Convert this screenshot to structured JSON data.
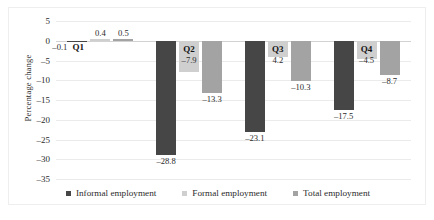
{
  "chart_data": {
    "type": "bar",
    "title": "",
    "subtitle": "",
    "xlabel": "",
    "ylabel": "Percentage change",
    "categories": [
      "Q1",
      "Q2",
      "Q3",
      "Q4"
    ],
    "series": [
      {
        "name": "Informal employment",
        "color": "#464646",
        "values": [
          -0.1,
          -28.8,
          -23.1,
          -17.5
        ],
        "labels": [
          "–0.1",
          "–28.8",
          "–23.1",
          "–17.5"
        ]
      },
      {
        "name": "Formal employment",
        "color": "#cfcfcf",
        "values": [
          0.4,
          -7.9,
          -4.2,
          -4.5
        ],
        "labels": [
          "0.4",
          "–7.9",
          "4.2",
          "–4.5"
        ]
      },
      {
        "name": "Total employment",
        "color": "#a3a3a3",
        "values": [
          0.5,
          -13.3,
          -10.3,
          -8.7
        ],
        "labels": [
          "0.5",
          "–13.3",
          "–10.3",
          "–8.7"
        ]
      }
    ],
    "ylim": [
      -35,
      5
    ],
    "yticks": [
      5,
      0,
      -5,
      -10,
      -15,
      -20,
      -25,
      -30,
      -35
    ],
    "ytick_labels": [
      "5",
      "0",
      "–5",
      "–10",
      "–15",
      "–20",
      "–25",
      "–30",
      "–35"
    ],
    "grid": true,
    "legend_position": "bottom"
  },
  "legend": {
    "items": [
      {
        "label": "Informal employment",
        "color": "#464646"
      },
      {
        "label": "Formal employment",
        "color": "#cfcfcf"
      },
      {
        "label": "Total employment",
        "color": "#a3a3a3"
      }
    ]
  }
}
